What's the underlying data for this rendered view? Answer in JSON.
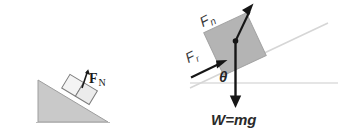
{
  "figure": {
    "background_color": "#ffffff",
    "panels": [
      {
        "id": "left",
        "name": "incline-with-normal-force",
        "incline": {
          "fill_color": "#c9c9c9",
          "stroke_color": "#8d8d8d",
          "apex_label": "",
          "description": "right triangle ramp, high side at left"
        },
        "block": {
          "fill_color": "#f2f2f2",
          "stroke_color": "#7a7a7a",
          "label": ""
        },
        "labels": {
          "normal_force": "F",
          "normal_force_subscript": "N"
        }
      },
      {
        "id": "right",
        "name": "free-body-diagram-on-incline",
        "block": {
          "fill_color": "#b4b4b4",
          "stroke_color": "#9a9a9a"
        },
        "incline_line_color": "#d4d4d4",
        "horizontal_line_color": "#d8d8d8",
        "arrow_color": "#161616",
        "labels": {
          "normal_force": "F",
          "normal_force_subscript": "n",
          "friction_force": "F",
          "friction_force_subscript": "r",
          "angle": "θ",
          "weight": "W=mg"
        }
      }
    ]
  }
}
